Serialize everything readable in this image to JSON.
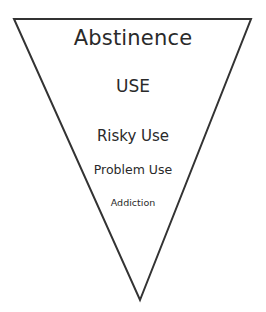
{
  "diagram": {
    "type": "inverted-triangle",
    "stroke_color": "#333333",
    "vertices": {
      "top_left": [
        14,
        19
      ],
      "top_right": [
        251,
        19
      ],
      "bottom": [
        140,
        300
      ]
    },
    "levels": [
      {
        "label": "Abstinence"
      },
      {
        "label": "USE"
      },
      {
        "label": "Risky Use"
      },
      {
        "label": "Problem Use"
      },
      {
        "label": "Addiction"
      }
    ]
  }
}
